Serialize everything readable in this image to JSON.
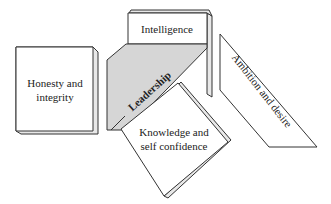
{
  "diagram": {
    "central": {
      "label": "Leadership",
      "fill": "#d6d6d6"
    },
    "nodes": [
      {
        "id": "honesty",
        "line1": "Honesty and",
        "line2": "integrity"
      },
      {
        "id": "intelligence",
        "line1": "Intelligence"
      },
      {
        "id": "ambition",
        "line1": "Ambition and desire"
      },
      {
        "id": "knowledge",
        "line1": "Knowledge and",
        "line2": "self confidence"
      }
    ],
    "colors": {
      "stroke": "#333333",
      "face": "#ffffff",
      "side": "#e8e8e8",
      "text": "#222222"
    }
  }
}
